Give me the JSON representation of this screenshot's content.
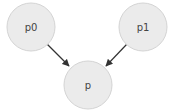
{
  "diagram": {
    "nodes": [
      {
        "id": "p0",
        "label": "p0",
        "cx": 31,
        "cy": 27,
        "r": 24
      },
      {
        "id": "p1",
        "label": "p1",
        "cx": 143,
        "cy": 27,
        "r": 24
      },
      {
        "id": "p",
        "label": "p",
        "cx": 88,
        "cy": 85,
        "r": 24
      }
    ],
    "edges": [
      {
        "from": "p0",
        "to": "p"
      },
      {
        "from": "p1",
        "to": "p"
      }
    ],
    "colors": {
      "node_fill": "#ebebeb",
      "node_stroke": "#d4d4d4",
      "edge": "#333333",
      "label": "#444444"
    }
  }
}
